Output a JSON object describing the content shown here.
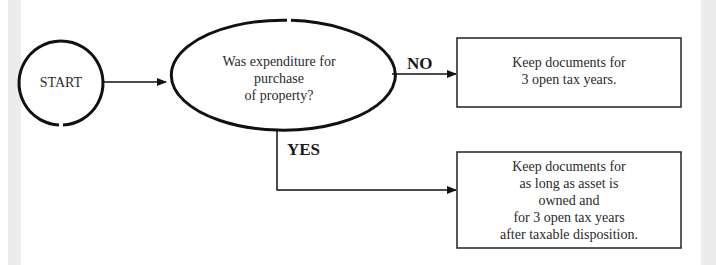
{
  "diagram": {
    "start": {
      "label": "START"
    },
    "decision": {
      "lines": [
        "Was expenditure for",
        "purchase",
        "of property?"
      ]
    },
    "branches": {
      "no_label": "NO",
      "yes_label": "YES"
    },
    "outcome_no": {
      "lines": [
        "Keep documents for",
        "3 open tax years."
      ]
    },
    "outcome_yes": {
      "lines": [
        "Keep documents for",
        "as long as asset is",
        "owned and",
        "for 3 open tax years",
        "after taxable disposition."
      ]
    }
  },
  "colors": {
    "stroke": "#111111",
    "side_strip": "#ececec",
    "background": "#ffffff"
  }
}
